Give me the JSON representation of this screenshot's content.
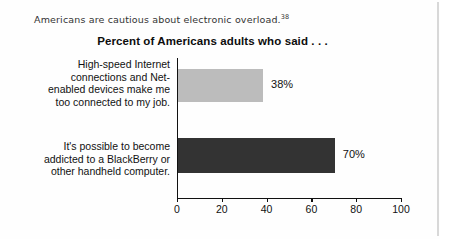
{
  "caption": {
    "text": "Americans are cautious about electronic overload.",
    "footnote": "38"
  },
  "chart_data": {
    "type": "bar",
    "orientation": "horizontal",
    "title": "Percent of Americans adults who said . . .",
    "xlabel": "",
    "ylabel": "",
    "xlim": [
      0,
      100
    ],
    "xticks": [
      0,
      20,
      40,
      60,
      80,
      100
    ],
    "xtick_labels": [
      "0",
      "20",
      "40",
      "60",
      "80",
      "100"
    ],
    "grid": false,
    "legend": "none",
    "categories": [
      "High-speed Internet connections and Net-enabled devices make me too connected to my job.",
      "It's possible to become addicted to a BlackBerry or other handheld computer."
    ],
    "category_lines": [
      [
        "High-speed Internet",
        "connections and Net-",
        "enabled devices make me",
        "too connected to my job."
      ],
      [
        "It's possible to become",
        "addicted to a BlackBerry or",
        "other handheld computer."
      ]
    ],
    "values": [
      38,
      70
    ],
    "value_labels": [
      "38%",
      "70%"
    ],
    "bar_colors": [
      "#bcbcbc",
      "#333333"
    ]
  }
}
